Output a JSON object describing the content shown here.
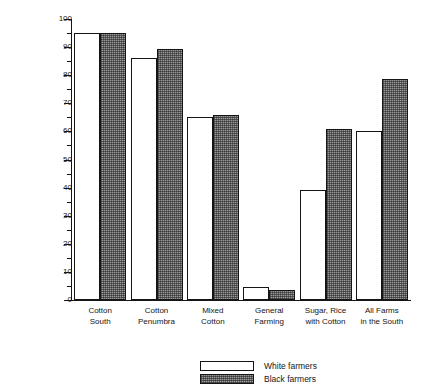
{
  "chart_data": {
    "type": "bar",
    "title": "",
    "xlabel": "",
    "ylabel": "Percent of farms",
    "ylim": [
      0,
      100
    ],
    "ytick_step": 10,
    "yminor_step": 5,
    "grid": false,
    "legend_position": "bottom-center",
    "categories": [
      "Cotton South",
      "Cotton Penumbra",
      "Mixed Cotton",
      "General Farming",
      "Sugar, Rice with Cotton",
      "All Farms in the South"
    ],
    "category_lines": [
      [
        "Cotton",
        "South"
      ],
      [
        "Cotton",
        "Penumbra"
      ],
      [
        "Mixed",
        "Cotton"
      ],
      [
        "General",
        "Farming"
      ],
      [
        "Sugar, Rice",
        "with Cotton"
      ],
      [
        "All Farms",
        "in the South"
      ]
    ],
    "tick_labels": [
      "0",
      "10",
      "20",
      "30",
      "40",
      "50",
      "60",
      "70",
      "80",
      "90",
      "100"
    ],
    "series": [
      {
        "name": "White farmers",
        "fill": "white",
        "values": [
          95,
          86,
          65,
          4.5,
          39,
          60
        ]
      },
      {
        "name": "Black farmers",
        "fill": "hatched-gray",
        "values": [
          95,
          89.5,
          66,
          3.5,
          61,
          78.5
        ]
      }
    ]
  },
  "legend": {
    "entries": [
      {
        "label": "White farmers",
        "fill": "white"
      },
      {
        "label": "Black farmers",
        "fill": "hatched-gray"
      }
    ]
  },
  "title_remnant": "",
  "colors": {
    "axis": "#151515",
    "white_series": "#ffffff",
    "black_series": "#9a9a9a",
    "text": "#151515"
  }
}
